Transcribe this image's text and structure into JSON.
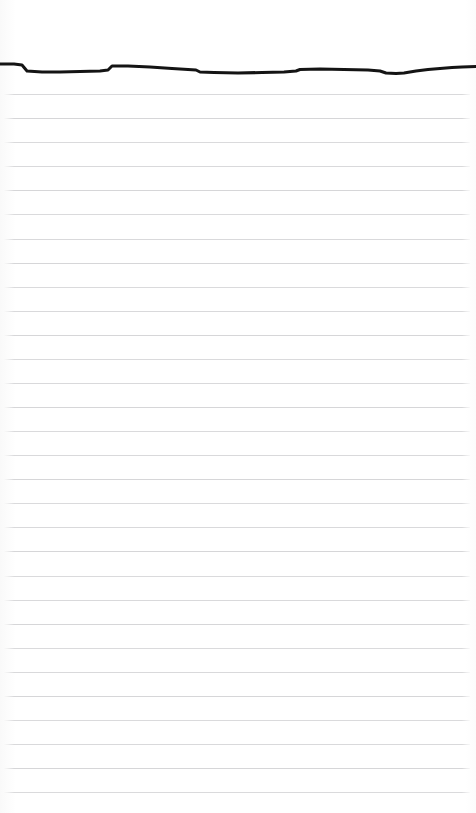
{
  "document": {
    "kind": "ruled-notepad-page",
    "title": "Blank lined notepad page",
    "page_width": 476,
    "page_height": 813,
    "background_color": "#ffffff",
    "written_text": "",
    "is_blank": true
  },
  "ruling": {
    "line_color": "#d6d6d8",
    "line_thickness_px": 1,
    "line_spacing_px": 24.1,
    "first_line_y": 94,
    "line_count": 30,
    "left_inset_px": 4,
    "right_inset_px": 6,
    "margin_rule_present": false,
    "line_y_positions": [
      94,
      118,
      142,
      166,
      190,
      214,
      239,
      263,
      287,
      311,
      335,
      359,
      383,
      407,
      431,
      455,
      479,
      503,
      527,
      551,
      576,
      600,
      624,
      648,
      672,
      696,
      720,
      744,
      768,
      792
    ]
  },
  "ink_stroke": {
    "name": "hand-drawn-horizontal-line",
    "color": "#141414",
    "stroke_width_px": 3,
    "description": "Single wavering hand-drawn horizontal pen line across the top of the page",
    "path": "M 0,64 L 14,64 L 22,65 L 27,71 L 42,72 L 60,72 L 80,71.5 L 100,71 L 108,70 L 112,66 L 128,66 L 150,67 L 172,68.5 L 196,70 L 200,72 L 214,72.5 L 238,73 L 262,72.5 L 284,72 L 296,71 L 300,69.5 L 320,69 L 344,69.5 L 368,70 L 380,71 L 386,73 L 396,73.5 L 404,73 L 416,71 L 428,69.5 L 440,68.5 L 452,67.5 L 462,67 L 476,66.5",
    "start_y": 64,
    "end_y": 66.5,
    "spans_full_width": true
  },
  "margins": {
    "top_blank_height_px": 60,
    "bottom_blank_height_px": 21
  }
}
